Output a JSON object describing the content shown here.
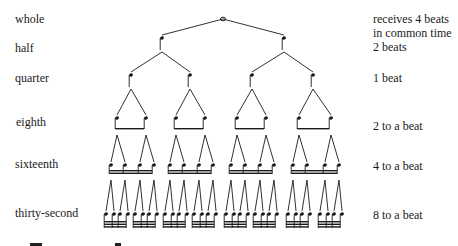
{
  "diagram": {
    "type": "note-value-tree",
    "levels": [
      {
        "name": "whole",
        "beats": "receives 4 beats",
        "beats_line2": "in common time",
        "y": 19,
        "count": 1
      },
      {
        "name": "half",
        "beats": "2 beats",
        "y": 49,
        "count": 2
      },
      {
        "name": "quarter",
        "beats": "1 beat",
        "y": 78,
        "count": 4
      },
      {
        "name": "eighth",
        "beats": "2 to a beat",
        "y": 122,
        "count": 8
      },
      {
        "name": "sixteenth",
        "beats": "4 to a beat",
        "y": 164,
        "count": 16
      },
      {
        "name": "thirty-second",
        "beats": "8 to a beat",
        "y": 213,
        "count": 32
      }
    ],
    "ink_color": "#1a1a1a"
  }
}
